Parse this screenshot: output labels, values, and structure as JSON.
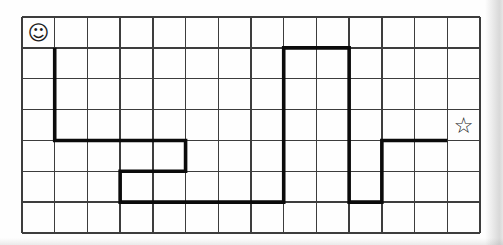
{
  "puzzle": {
    "background_color": "#fefefe",
    "grid": {
      "cols": 14,
      "rows": 7,
      "x": 22,
      "y": 17,
      "width": 458,
      "height": 216,
      "line_color": "#3d3d3d",
      "line_width": 1.3,
      "border_width": 2
    },
    "path": {
      "color": "#0b0b0b",
      "width": 3.6,
      "points": [
        [
          1,
          1
        ],
        [
          1,
          4
        ],
        [
          5,
          4
        ],
        [
          5,
          5
        ],
        [
          3,
          5
        ],
        [
          3,
          6
        ],
        [
          8,
          6
        ],
        [
          8,
          1
        ],
        [
          10,
          1
        ],
        [
          10,
          6
        ],
        [
          11,
          6
        ],
        [
          11,
          4
        ],
        [
          13,
          4
        ]
      ]
    },
    "markers": {
      "start": {
        "glyph": "☺",
        "cell": [
          0,
          0
        ]
      },
      "goal": {
        "glyph": "☆",
        "cell": [
          13,
          3
        ]
      }
    }
  }
}
